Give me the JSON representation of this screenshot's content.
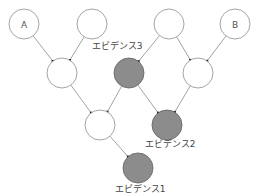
{
  "diagram": {
    "type": "bayesian-network",
    "colors": {
      "edge": "#8a8a8a",
      "node_stroke": "#9a9a9a",
      "node_fill": "#ffffff",
      "evidence_fill": "#8c8c8c",
      "evidence_stroke": "#6a6a6a"
    },
    "nodes": [
      {
        "id": "A",
        "label": "A",
        "x": 24,
        "y": 24,
        "evidence": false
      },
      {
        "id": "T2",
        "label": "",
        "x": 92,
        "y": 24,
        "evidence": false
      },
      {
        "id": "T3",
        "label": "",
        "x": 169,
        "y": 24,
        "evidence": false
      },
      {
        "id": "B",
        "label": "B",
        "x": 235,
        "y": 24,
        "evidence": false
      },
      {
        "id": "M1",
        "label": "",
        "x": 62,
        "y": 73,
        "evidence": false
      },
      {
        "id": "E3",
        "label": "エビデンス3",
        "x": 129,
        "y": 73,
        "evidence": true
      },
      {
        "id": "M3",
        "label": "",
        "x": 198,
        "y": 73,
        "evidence": false
      },
      {
        "id": "L1",
        "label": "",
        "x": 100,
        "y": 125,
        "evidence": false
      },
      {
        "id": "E2",
        "label": "エビデンス2",
        "x": 167,
        "y": 125,
        "evidence": true
      },
      {
        "id": "E1",
        "label": "エビデンス1",
        "x": 138,
        "y": 168,
        "evidence": true
      }
    ],
    "edges": [
      {
        "from": "A",
        "to": "M1"
      },
      {
        "from": "T2",
        "to": "M1"
      },
      {
        "from": "T3",
        "to": "E3"
      },
      {
        "from": "T3",
        "to": "M3"
      },
      {
        "from": "B",
        "to": "M3"
      },
      {
        "from": "M1",
        "to": "L1"
      },
      {
        "from": "E3",
        "to": "L1"
      },
      {
        "from": "E3",
        "to": "E2"
      },
      {
        "from": "M3",
        "to": "E2"
      },
      {
        "from": "L1",
        "to": "E1"
      }
    ],
    "labels": {
      "a": "A",
      "b": "B",
      "evidence1": "エビデンス1",
      "evidence2": "エビデンス2",
      "evidence3": "エビデンス3"
    }
  }
}
